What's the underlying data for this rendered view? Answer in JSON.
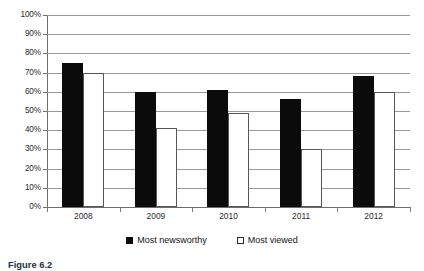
{
  "figure": {
    "caption": "Figure 6.2"
  },
  "legend": {
    "position": "bottom-center",
    "items": [
      {
        "label": "Most newsworthy",
        "swatch": "filled-square-icon",
        "color": "#0b0b0b"
      },
      {
        "label": "Most viewed",
        "swatch": "outlined-square-icon",
        "color": "#ffffff"
      }
    ]
  },
  "axes": {
    "y_ticks": [
      "0%",
      "10%",
      "20%",
      "30%",
      "40%",
      "50%",
      "60%",
      "70%",
      "80%",
      "90%",
      "100%"
    ],
    "x_ticks": [
      "2008",
      "2009",
      "2010",
      "2011",
      "2012"
    ]
  },
  "chart_data": {
    "type": "bar",
    "title": "",
    "subtitle": "",
    "xlabel": "",
    "ylabel": "",
    "categories": [
      "2008",
      "2009",
      "2010",
      "2011",
      "2012"
    ],
    "series": [
      {
        "name": "Most newsworthy",
        "color": "#0b0b0b",
        "values": [
          75,
          60,
          61,
          56,
          68
        ]
      },
      {
        "name": "Most viewed",
        "color": "#ffffff",
        "values": [
          70,
          41,
          49,
          30,
          60
        ]
      }
    ],
    "ylim": [
      0,
      100
    ],
    "ytick_step": 10,
    "ytick_format": "percent",
    "grid": "horizontal",
    "legend_position": "bottom-center"
  }
}
